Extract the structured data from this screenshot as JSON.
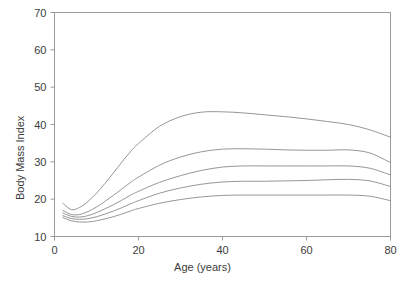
{
  "chart_data": {
    "type": "line",
    "title": "",
    "xlabel": "Age (years)",
    "ylabel": "Body Mass Index",
    "xlim": [
      0,
      80
    ],
    "ylim": [
      10,
      70
    ],
    "xticks": [
      0,
      20,
      40,
      60,
      80
    ],
    "yticks": [
      10,
      20,
      30,
      40,
      50,
      60,
      70
    ],
    "grid": false,
    "legend": "none",
    "line_color": "#8a8a8a",
    "x": [
      2,
      4,
      6,
      8,
      10,
      12,
      14,
      16,
      18,
      20,
      25,
      30,
      35,
      40,
      45,
      50,
      55,
      60,
      65,
      70,
      75,
      80
    ],
    "series": [
      {
        "name": "curve-1-highest",
        "values": [
          18.9,
          17.2,
          17.8,
          19.4,
          21.6,
          24.2,
          27.0,
          29.9,
          32.6,
          34.9,
          39.5,
          42.1,
          43.3,
          43.4,
          43.1,
          42.6,
          42.1,
          41.5,
          40.8,
          40.0,
          38.6,
          36.6
        ]
      },
      {
        "name": "curve-2",
        "values": [
          17.0,
          15.9,
          15.9,
          16.7,
          17.9,
          19.4,
          21.0,
          22.7,
          24.4,
          25.9,
          29.1,
          31.3,
          32.7,
          33.4,
          33.5,
          33.4,
          33.2,
          33.1,
          33.1,
          33.2,
          32.4,
          29.8
        ]
      },
      {
        "name": "curve-3-median",
        "values": [
          16.3,
          15.4,
          15.2,
          15.6,
          16.4,
          17.4,
          18.5,
          19.7,
          21.0,
          22.1,
          24.5,
          26.3,
          27.7,
          28.6,
          28.9,
          28.9,
          28.9,
          28.9,
          28.9,
          28.9,
          28.3,
          26.5
        ]
      },
      {
        "name": "curve-4",
        "values": [
          15.6,
          14.8,
          14.6,
          14.8,
          15.3,
          16.0,
          16.8,
          17.7,
          18.7,
          19.6,
          21.6,
          23.0,
          24.0,
          24.6,
          24.8,
          24.8,
          24.9,
          25.0,
          25.2,
          25.3,
          24.9,
          23.4
        ]
      },
      {
        "name": "curve-5-lowest",
        "values": [
          15.1,
          14.2,
          13.9,
          13.9,
          14.2,
          14.7,
          15.3,
          16.0,
          16.8,
          17.5,
          18.9,
          19.9,
          20.6,
          21.0,
          21.1,
          21.1,
          21.1,
          21.1,
          21.1,
          21.1,
          20.8,
          19.6
        ]
      }
    ]
  }
}
